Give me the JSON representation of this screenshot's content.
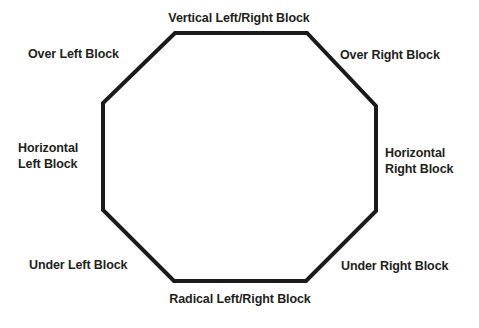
{
  "diagram": {
    "type": "octagon-block-diagram",
    "shape": {
      "name": "octagon",
      "stroke_color": "#1a1a1a",
      "stroke_width": 4,
      "fill_color": "#ffffff",
      "vertices": [
        [
          175,
          33
        ],
        [
          307,
          33
        ],
        [
          376,
          106
        ],
        [
          376,
          211
        ],
        [
          306,
          281
        ],
        [
          174,
          281
        ],
        [
          103,
          210
        ],
        [
          103,
          103
        ]
      ]
    },
    "background_color": "#ffffff",
    "text_color": "#231f20",
    "labels": [
      {
        "id": "vertical-left-right-block",
        "text": "Vertical Left/Right Block",
        "position": "top"
      },
      {
        "id": "over-left-block",
        "text": "Over Left Block",
        "position": "top-left"
      },
      {
        "id": "over-right-block",
        "text": "Over Right Block",
        "position": "top-right"
      },
      {
        "id": "horizontal-left-block",
        "text": "Horizontal\nLeft Block",
        "position": "left"
      },
      {
        "id": "horizontal-right-block",
        "text": "Horizontal\nRight Block",
        "position": "right"
      },
      {
        "id": "under-left-block",
        "text": "Under Left Block",
        "position": "bottom-left"
      },
      {
        "id": "under-right-block",
        "text": "Under Right Block",
        "position": "bottom-right"
      },
      {
        "id": "radical-left-right-block",
        "text": "Radical Left/Right Block",
        "position": "bottom"
      }
    ]
  }
}
